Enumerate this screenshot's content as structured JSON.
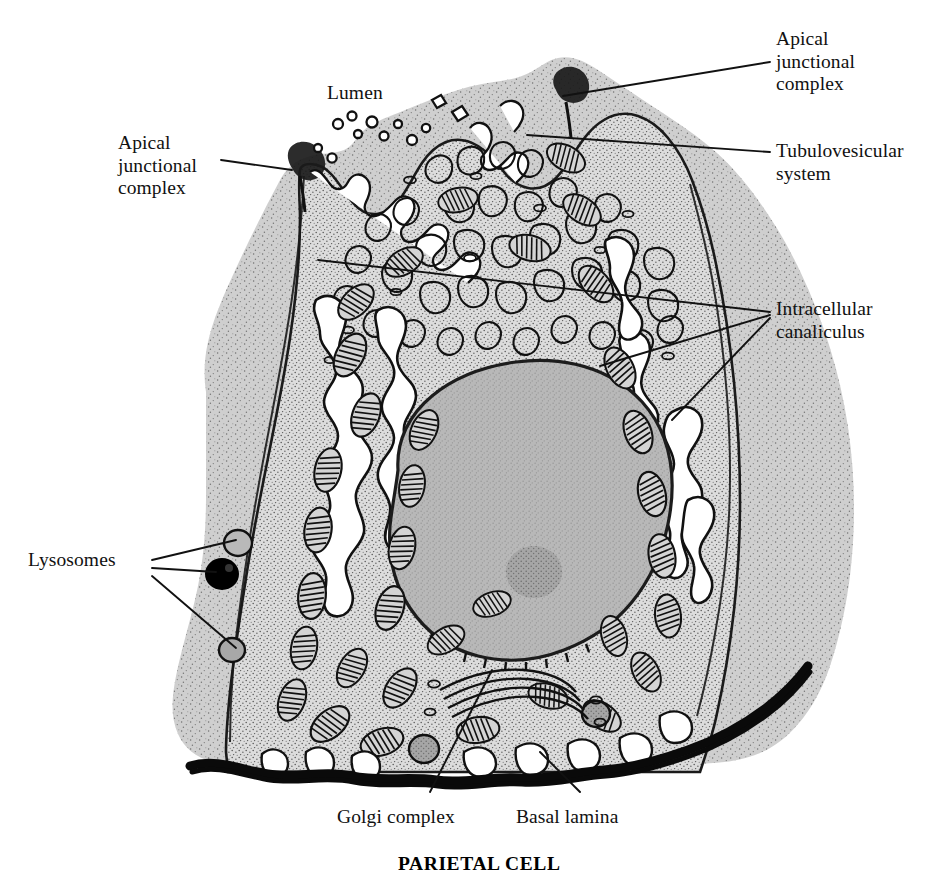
{
  "figure": {
    "caption": "PARIETAL CELL",
    "kind": "labelled-line-drawing",
    "background_color": "#ffffff",
    "ink_color": "#111111",
    "palette": {
      "neighbour_cell_fill": "#cfcfcf",
      "cytoplasm_fill": "#d8d8d8",
      "nucleus_fill": "#b3b3b3",
      "nucleolus_fill": "#9a9a9a",
      "canaliculus_lumen": "#ffffff",
      "lysosome_dark": "#000000",
      "basal_lamina": "#0a0a0a"
    }
  },
  "labels": [
    {
      "id": "apical-junctional-complex-left",
      "text": "Apical\njunctional\ncomplex",
      "align": "left",
      "x": 118,
      "y": 132
    },
    {
      "id": "lumen",
      "text": "Lumen",
      "align": "left",
      "x": 327,
      "y": 82
    },
    {
      "id": "apical-junctional-complex-right",
      "text": "Apical\njunctional\ncomplex",
      "align": "left",
      "x": 776,
      "y": 28
    },
    {
      "id": "tubulovesicular-system",
      "text": "Tubulovesicular\nsystem",
      "align": "left",
      "x": 776,
      "y": 140
    },
    {
      "id": "intracellular-canaliculus",
      "text": "Intracellular\ncanaliculus",
      "align": "left",
      "x": 776,
      "y": 298
    },
    {
      "id": "lysosomes",
      "text": "Lysosomes",
      "align": "left",
      "x": 28,
      "y": 549
    },
    {
      "id": "golgi-complex",
      "text": "Golgi complex",
      "align": "left",
      "x": 337,
      "y": 806
    },
    {
      "id": "basal-lamina",
      "text": "Basal lamina",
      "align": "left",
      "x": 516,
      "y": 806
    }
  ],
  "caption": {
    "text": "PARIETAL CELL",
    "x": 398,
    "y": 853
  },
  "leader_lines": [
    {
      "id": "leader-ajc-left",
      "from": [
        221,
        160
      ],
      "to": [
        292,
        170
      ]
    },
    {
      "id": "leader-ajc-right",
      "from": [
        770,
        62
      ],
      "to": [
        563,
        96
      ]
    },
    {
      "id": "leader-tvs",
      "from": [
        770,
        152
      ],
      "to": [
        527,
        135
      ]
    },
    {
      "id": "leader-canal-1",
      "from": [
        770,
        312
      ],
      "to": [
        318,
        260
      ]
    },
    {
      "id": "leader-canal-2",
      "from": [
        770,
        315
      ],
      "to": [
        600,
        366
      ]
    },
    {
      "id": "leader-canal-3",
      "from": [
        770,
        318
      ],
      "to": [
        672,
        420
      ]
    },
    {
      "id": "leader-lyso-1",
      "from": [
        152,
        560
      ],
      "to": [
        236,
        540
      ]
    },
    {
      "id": "leader-lyso-2",
      "from": [
        152,
        568
      ],
      "to": [
        216,
        572
      ]
    },
    {
      "id": "leader-lyso-3",
      "from": [
        152,
        576
      ],
      "to": [
        236,
        648
      ]
    },
    {
      "id": "leader-golgi",
      "from": [
        430,
        792
      ],
      "to": [
        492,
        670
      ]
    },
    {
      "id": "leader-basal",
      "from": [
        580,
        792
      ],
      "to": [
        540,
        752
      ]
    }
  ],
  "organelle_counts": {
    "mitochondria": 34,
    "lysosomes": 3,
    "nucleolus": 1,
    "golgi_stacks": 2
  }
}
